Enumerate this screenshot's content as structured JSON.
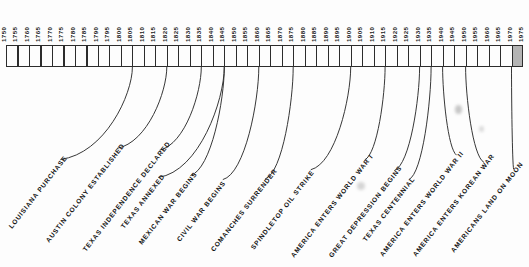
{
  "figure": {
    "kind": "historical-timeline",
    "title": "",
    "axis_start_year": 1750,
    "axis_end_year": 1975,
    "tick_interval_years": 5,
    "ink_color": "#2c2c2c",
    "shade_color": "#b4b4b4",
    "background_color": "#fdfdfd"
  },
  "axis": {
    "years": [
      "1750",
      "1755",
      "1760",
      "1765",
      "1770",
      "1775",
      "1780",
      "1785",
      "1790",
      "1795",
      "1800",
      "1805",
      "1810",
      "1815",
      "1820",
      "1825",
      "1830",
      "1835",
      "1840",
      "1845",
      "1850",
      "1855",
      "1860",
      "1865",
      "1870",
      "1875",
      "1880",
      "1885",
      "1890",
      "1895",
      "1900",
      "1905",
      "1910",
      "1915",
      "1920",
      "1925",
      "1930",
      "1935",
      "1940",
      "1945",
      "1950",
      "1955",
      "1960",
      "1965",
      "1970",
      "1975"
    ],
    "shaded_span": {
      "from_year": "1970",
      "to_year": "1975"
    }
  },
  "events": [
    {
      "label": "LOUISIANA PURCHASE",
      "year": "1805"
    },
    {
      "label": "AUSTIN COLONY ESTABLISHED",
      "year": "1820"
    },
    {
      "label": "TEXAS INDEPENDENCE DECLARED",
      "year": "1835"
    },
    {
      "label": "TEXAS ANNEXED",
      "year": "1845"
    },
    {
      "label": "MEXICAN WAR BEGINS",
      "year": "1845"
    },
    {
      "label": "CIVIL WAR BEGINS",
      "year": "1860"
    },
    {
      "label": "COMANCHES SURRENDER",
      "year": "1875"
    },
    {
      "label": "SPINDLETOP OIL STRIKE",
      "year": "1900"
    },
    {
      "label": "AMERICA ENTERS WORLD WAR I",
      "year": "1915"
    },
    {
      "label": "GREAT DEPRESSION BEGINS",
      "year": "1930"
    },
    {
      "label": "TEXAS CENTENNIAL",
      "year": "1935"
    },
    {
      "label": "AMERICA ENTERS WORLD WAR II",
      "year": "1940"
    },
    {
      "label": "AMERICA ENTERS KOREAN WAR",
      "year": "1950"
    },
    {
      "label": "AMERICANS LAND ON MOON",
      "year": "1970"
    }
  ],
  "chart_data": {
    "type": "timeline",
    "title": "",
    "xlabel": "",
    "ylabel": "",
    "xlim": [
      1750,
      1975
    ],
    "tick_step": 5,
    "grid": false,
    "legend": "none",
    "categories": [
      "1750",
      "1755",
      "1760",
      "1765",
      "1770",
      "1775",
      "1780",
      "1785",
      "1790",
      "1795",
      "1800",
      "1805",
      "1810",
      "1815",
      "1820",
      "1825",
      "1830",
      "1835",
      "1840",
      "1845",
      "1850",
      "1855",
      "1860",
      "1865",
      "1870",
      "1875",
      "1880",
      "1885",
      "1890",
      "1895",
      "1900",
      "1905",
      "1910",
      "1915",
      "1920",
      "1925",
      "1930",
      "1935",
      "1940",
      "1945",
      "1950",
      "1955",
      "1960",
      "1965",
      "1970",
      "1975"
    ],
    "annotations": [
      {
        "text": "LOUISIANA PURCHASE",
        "x": 1805
      },
      {
        "text": "AUSTIN COLONY ESTABLISHED",
        "x": 1820
      },
      {
        "text": "TEXAS INDEPENDENCE DECLARED",
        "x": 1835
      },
      {
        "text": "TEXAS ANNEXED",
        "x": 1845
      },
      {
        "text": "MEXICAN WAR BEGINS",
        "x": 1845
      },
      {
        "text": "CIVIL WAR BEGINS",
        "x": 1860
      },
      {
        "text": "COMANCHES SURRENDER",
        "x": 1875
      },
      {
        "text": "SPINDLETOP OIL STRIKE",
        "x": 1900
      },
      {
        "text": "AMERICA ENTERS WORLD WAR I",
        "x": 1915
      },
      {
        "text": "GREAT DEPRESSION BEGINS",
        "x": 1930
      },
      {
        "text": "TEXAS CENTENNIAL",
        "x": 1935
      },
      {
        "text": "AMERICA ENTERS WORLD WAR II",
        "x": 1940
      },
      {
        "text": "AMERICA ENTERS KOREAN WAR",
        "x": 1950
      },
      {
        "text": "AMERICANS LAND ON MOON",
        "x": 1970
      }
    ],
    "shaded_regions": [
      {
        "from": 1970,
        "to": 1975
      }
    ]
  }
}
